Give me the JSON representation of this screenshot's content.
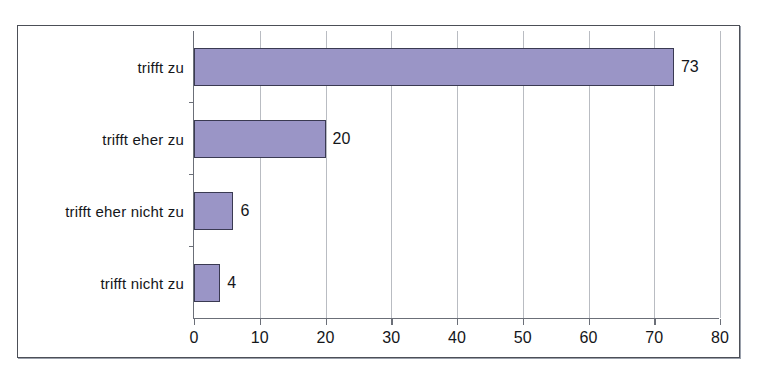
{
  "scan": {
    "top_cut_text": "",
    "background_color": "#ffffff",
    "frame_color": "#4c4f57"
  },
  "chart_data": {
    "type": "bar",
    "orientation": "horizontal",
    "title": "",
    "subtitle": "",
    "xlabel": "",
    "ylabel": "",
    "categories": [
      "trifft zu",
      "trifft eher zu",
      "trifft eher nicht zu",
      "trifft nicht zu"
    ],
    "values": [
      73,
      20,
      6,
      4
    ],
    "data_labels": [
      "73",
      "20",
      "6",
      "4"
    ],
    "xlim": [
      0,
      80
    ],
    "xticks": [
      0,
      10,
      20,
      30,
      40,
      50,
      60,
      70,
      80
    ],
    "xtick_labels": [
      "0",
      "10",
      "20",
      "30",
      "40",
      "50",
      "60",
      "70",
      "80"
    ],
    "grid": true,
    "grid_axis": "x",
    "legend": false,
    "legend_position": "none",
    "bar_fill_color": "#9a95c6",
    "bar_border_color": "#3a3a52",
    "gridline_color": "#b9bcc2",
    "axis_color": "#6b6f78",
    "text_color": "#14161a"
  }
}
